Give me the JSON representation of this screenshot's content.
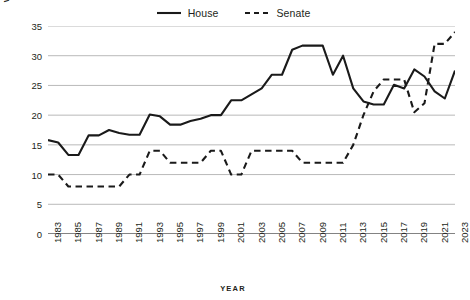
{
  "legend": {
    "position": "top-center",
    "entries": [
      {
        "label": "House",
        "style": "solid",
        "color": "#1a1a1a",
        "icon": "solid-line-icon"
      },
      {
        "label": "Senate",
        "style": "dashed",
        "color": "#1a1a1a",
        "icon": "dashed-line-icon"
      }
    ]
  },
  "axes": {
    "y_title": "WOMEN BY CHAMBER (%)",
    "x_title": "YEAR",
    "y_ticks": [
      "0",
      "5",
      "10",
      "15",
      "20",
      "25",
      "30",
      "35"
    ],
    "x_ticks": [
      "1983",
      "1985",
      "1987",
      "1989",
      "1991",
      "1993",
      "1995",
      "1997",
      "1999",
      "2001",
      "2003",
      "2005",
      "2007",
      "2009",
      "2011",
      "2013",
      "2015",
      "2017",
      "2019",
      "2021",
      "2023"
    ]
  },
  "colors": {
    "line": "#1a1a1a",
    "grid": "#9a9a9a",
    "axis": "#3a3a3a",
    "text": "#231f20",
    "background": "#ffffff"
  },
  "chart_data": {
    "type": "line",
    "title": "",
    "subtitle": "",
    "xlabel": "YEAR",
    "ylabel": "WOMEN BY CHAMBER (%)",
    "xlim": [
      1983,
      2023
    ],
    "ylim": [
      0,
      35
    ],
    "grid": "horizontal",
    "legend_position": "top-center",
    "x": [
      1983,
      1984,
      1985,
      1986,
      1987,
      1988,
      1989,
      1990,
      1991,
      1992,
      1993,
      1994,
      1995,
      1996,
      1997,
      1998,
      1999,
      2000,
      2001,
      2002,
      2003,
      2004,
      2005,
      2006,
      2007,
      2008,
      2009,
      2010,
      2011,
      2012,
      2013,
      2014,
      2015,
      2016,
      2017,
      2018,
      2019,
      2020,
      2021,
      2022,
      2023
    ],
    "series": [
      {
        "name": "House",
        "style": "solid",
        "color": "#1a1a1a",
        "values": [
          15.8,
          15.4,
          13.3,
          13.3,
          16.6,
          16.6,
          17.5,
          17.0,
          16.7,
          16.7,
          20.1,
          19.8,
          18.4,
          18.4,
          19.0,
          19.4,
          20.0,
          20.0,
          22.5,
          22.5,
          23.5,
          24.5,
          26.8,
          26.8,
          31.0,
          31.7,
          31.7,
          31.7,
          26.8,
          30.0,
          24.5,
          22.3,
          21.8,
          21.8,
          25.1,
          24.5,
          27.7,
          26.5,
          24.0,
          22.8,
          27.5
        ]
      },
      {
        "name": "Senate",
        "style": "dashed",
        "color": "#1a1a1a",
        "values": [
          10.0,
          10.0,
          8.0,
          8.0,
          8.0,
          8.0,
          8.0,
          8.0,
          10.0,
          10.0,
          14.0,
          14.0,
          12.0,
          12.0,
          12.0,
          12.0,
          14.0,
          14.0,
          10.0,
          10.0,
          14.0,
          14.0,
          14.0,
          14.0,
          14.0,
          12.0,
          12.0,
          12.0,
          12.0,
          12.0,
          15.0,
          20.0,
          24.0,
          26.0,
          26.0,
          26.0,
          20.5,
          22.0,
          32.0,
          32.0,
          34.0
        ]
      }
    ]
  }
}
